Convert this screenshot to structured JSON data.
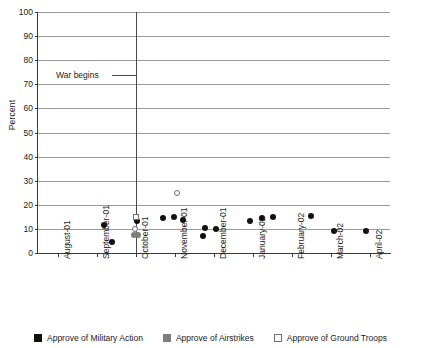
{
  "chart_data": {
    "type": "scatter",
    "title": "",
    "xlabel": "",
    "ylabel": "Percent",
    "ylim": [
      0,
      100
    ],
    "ytick_step": 10,
    "yticks": [
      "0",
      "10",
      "20",
      "30",
      "40",
      "50",
      "60",
      "70",
      "80",
      "90",
      "100"
    ],
    "categories": [
      "August-01",
      "September-01",
      "October-01",
      "November-01",
      "December-01",
      "January-02",
      "February-02",
      "March-02",
      "April-02"
    ],
    "grid": true,
    "legend_position": "bottom",
    "annotations": [
      {
        "text": "War begins",
        "at_category": "October-01",
        "type": "vertical-line-with-label"
      }
    ],
    "series": [
      {
        "name": "Approve of Military Action",
        "marker": "filled-circle",
        "color": "#111111",
        "points": [
          {
            "x": 1.18,
            "y": 11.5
          },
          {
            "x": 1.4,
            "y": 4.5
          },
          {
            "x": 2.02,
            "y": 13.2
          },
          {
            "x": 2.7,
            "y": 14.5
          },
          {
            "x": 2.98,
            "y": 15.0
          },
          {
            "x": 3.22,
            "y": 13.5
          },
          {
            "x": 3.72,
            "y": 7.0
          },
          {
            "x": 3.78,
            "y": 10.3
          },
          {
            "x": 4.06,
            "y": 10.0
          },
          {
            "x": 4.92,
            "y": 13.2
          },
          {
            "x": 5.22,
            "y": 14.7
          },
          {
            "x": 5.52,
            "y": 14.8
          },
          {
            "x": 6.48,
            "y": 15.2
          },
          {
            "x": 7.08,
            "y": 9.0
          },
          {
            "x": 7.88,
            "y": 9.3
          }
        ]
      },
      {
        "name": "Approve of Airstrikes",
        "marker": "filled-circle",
        "color": "#7d7d7d",
        "points": [
          {
            "x": 1.96,
            "y": 7.6
          },
          {
            "x": 2.06,
            "y": 7.4
          }
        ]
      },
      {
        "name": "Approve of Ground Troops",
        "marker": "open-marker",
        "color": "#ffffff",
        "points": [
          {
            "x": 2.0,
            "y": 15.0,
            "shape": "square"
          },
          {
            "x": 1.99,
            "y": 9.8,
            "shape": "circle"
          },
          {
            "x": 3.06,
            "y": 24.8,
            "shape": "circle"
          }
        ]
      }
    ]
  },
  "legend": {
    "items": [
      {
        "label": "Approve of Military Action",
        "swatch": "black-square-icon"
      },
      {
        "label": "Approve of Airstrikes",
        "swatch": "gray-square-icon"
      },
      {
        "label": "Approve of Ground Troops",
        "swatch": "open-square-icon"
      }
    ]
  }
}
